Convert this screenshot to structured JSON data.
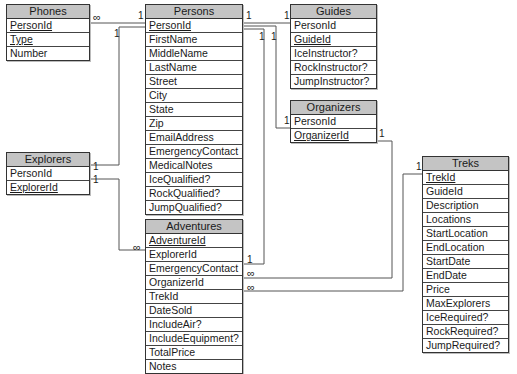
{
  "entities": {
    "phones": {
      "title": "Phones",
      "fields": [
        {
          "name": "PersonId",
          "key": true
        },
        {
          "name": "Type",
          "key": true
        },
        {
          "name": "Number",
          "key": false
        }
      ]
    },
    "persons": {
      "title": "Persons",
      "fields": [
        {
          "name": "PersonId",
          "key": true
        },
        {
          "name": "FirstName",
          "key": false
        },
        {
          "name": "MiddleName",
          "key": false
        },
        {
          "name": "LastName",
          "key": false
        },
        {
          "name": "Street",
          "key": false
        },
        {
          "name": "City",
          "key": false
        },
        {
          "name": "State",
          "key": false
        },
        {
          "name": "Zip",
          "key": false
        },
        {
          "name": "EmailAddress",
          "key": false
        },
        {
          "name": "EmergencyContact",
          "key": false
        },
        {
          "name": "MedicalNotes",
          "key": false
        },
        {
          "name": "IceQualified?",
          "key": false
        },
        {
          "name": "RockQualified?",
          "key": false
        },
        {
          "name": "JumpQualified?",
          "key": false
        }
      ]
    },
    "guides": {
      "title": "Guides",
      "fields": [
        {
          "name": "PersonId",
          "key": false
        },
        {
          "name": "GuideId",
          "key": true
        },
        {
          "name": "IceInstructor?",
          "key": false
        },
        {
          "name": "RockInstructor?",
          "key": false
        },
        {
          "name": "JumpInstructor?",
          "key": false
        }
      ]
    },
    "organizers": {
      "title": "Organizers",
      "fields": [
        {
          "name": "PersonId",
          "key": false
        },
        {
          "name": "OrganizerId",
          "key": true
        }
      ]
    },
    "explorers": {
      "title": "Explorers",
      "fields": [
        {
          "name": "PersonId",
          "key": false
        },
        {
          "name": "ExplorerId",
          "key": true
        }
      ]
    },
    "adventures": {
      "title": "Adventures",
      "fields": [
        {
          "name": "AdventureId",
          "key": true
        },
        {
          "name": "ExplorerId",
          "key": false
        },
        {
          "name": "EmergencyContact",
          "key": false
        },
        {
          "name": "OrganizerId",
          "key": false
        },
        {
          "name": "TrekId",
          "key": false
        },
        {
          "name": "DateSold",
          "key": false
        },
        {
          "name": "IncludeAir?",
          "key": false
        },
        {
          "name": "IncludeEquipment?",
          "key": false
        },
        {
          "name": "TotalPrice",
          "key": false
        },
        {
          "name": "Notes",
          "key": false
        }
      ]
    },
    "treks": {
      "title": "Treks",
      "fields": [
        {
          "name": "TrekId",
          "key": true
        },
        {
          "name": "GuideId",
          "key": false
        },
        {
          "name": "Description",
          "key": false
        },
        {
          "name": "Locations",
          "key": false
        },
        {
          "name": "StartLocation",
          "key": false
        },
        {
          "name": "EndLocation",
          "key": false
        },
        {
          "name": "StartDate",
          "key": false
        },
        {
          "name": "EndDate",
          "key": false
        },
        {
          "name": "Price",
          "key": false
        },
        {
          "name": "MaxExplorers",
          "key": false
        },
        {
          "name": "IceRequired?",
          "key": false
        },
        {
          "name": "RockRequired?",
          "key": false
        },
        {
          "name": "JumpRequired?",
          "key": false
        }
      ]
    }
  },
  "cardinality": {
    "one": "1",
    "many": "∞"
  },
  "relationships": [
    {
      "from": "Persons.PersonId",
      "to": "Phones.PersonId",
      "from_card": "1",
      "to_card": "∞"
    },
    {
      "from": "Persons.PersonId",
      "to": "Guides.PersonId",
      "from_card": "1",
      "to_card": "1"
    },
    {
      "from": "Persons.PersonId",
      "to": "Organizers.PersonId",
      "from_card": "1",
      "to_card": "1"
    },
    {
      "from": "Persons.PersonId",
      "to": "Explorers.PersonId",
      "from_card": "1",
      "to_card": "1"
    },
    {
      "from": "Persons.PersonId",
      "to": "Adventures.EmergencyContact",
      "from_card": "1",
      "to_card": "1"
    },
    {
      "from": "Explorers.ExplorerId",
      "to": "Adventures.ExplorerId",
      "from_card": "1",
      "to_card": "∞"
    },
    {
      "from": "Organizers.OrganizerId",
      "to": "Adventures.OrganizerId",
      "from_card": "1",
      "to_card": "∞"
    },
    {
      "from": "Treks.TrekId",
      "to": "Adventures.TrekId",
      "from_card": "1",
      "to_card": "∞"
    }
  ],
  "colors": {
    "header_bg": "#c4c4c4",
    "border": "#333333",
    "line": "#555555"
  }
}
